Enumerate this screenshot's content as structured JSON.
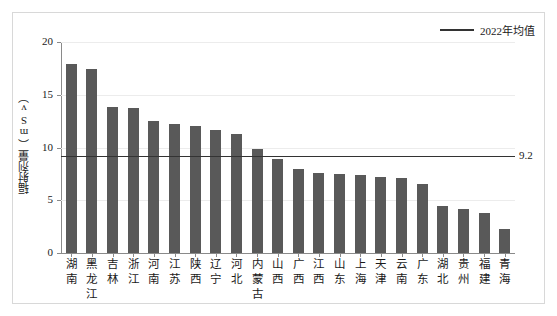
{
  "chart_data": {
    "type": "bar",
    "title": "",
    "xlabel": "",
    "ylabel": "辐射剂量（mSv）",
    "ylim": [
      0,
      20
    ],
    "yticks": [
      "0",
      "5",
      "10",
      "15",
      "20"
    ],
    "grid": true,
    "legend_position": "top-right",
    "legend": [
      {
        "name": "2022年均值",
        "type": "line",
        "color": "#333333"
      }
    ],
    "bar_color": "#595959",
    "categories": [
      "湖南",
      "黑龙江",
      "吉林",
      "浙江",
      "河南",
      "江苏",
      "陕西",
      "辽宁",
      "河北",
      "内蒙古",
      "山西",
      "广西",
      "江西",
      "山东",
      "上海",
      "天津",
      "云南",
      "广东",
      "湖北",
      "贵州",
      "福建",
      "青海"
    ],
    "values": [
      17.9,
      17.4,
      13.8,
      13.7,
      12.5,
      12.2,
      12.0,
      11.7,
      11.3,
      9.9,
      8.9,
      8.0,
      7.6,
      7.5,
      7.4,
      7.2,
      7.1,
      6.5,
      4.5,
      4.2,
      3.8,
      2.3
    ],
    "reference_line": {
      "label": "9.2",
      "value": 9.2,
      "name": "2022年均值",
      "color": "#333333"
    }
  }
}
